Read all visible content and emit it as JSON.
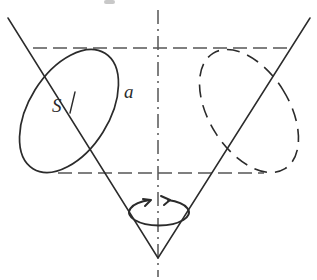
{
  "figure": {
    "background_color": "#ffffff",
    "stroke_color": "#2b2b2b",
    "dash_color": "#555555"
  },
  "labels": {
    "s": "S",
    "a": "a"
  },
  "geometry": {
    "canvas": {
      "width": 317,
      "height": 280
    },
    "apex": {
      "x": 158,
      "y": 258
    },
    "axis": {
      "name": "axis-of-revolution",
      "style": "dash-dot",
      "x": 158,
      "y_top": 10,
      "y_bottom": 277
    },
    "top_rim_line": {
      "name": "upper-construction-line",
      "style": "dashed",
      "y": 48,
      "x_start": 33,
      "x_end": 285
    },
    "mid_rim_line": {
      "name": "lower-construction-line",
      "style": "dashed",
      "y": 173,
      "x_start": 60,
      "x_end": 262
    },
    "cone_left_slant": {
      "x1": 8,
      "y1": 18,
      "x2": 158,
      "y2": 258
    },
    "cone_right_slant": {
      "x1": 310,
      "y1": 18,
      "x2": 158,
      "y2": 258
    },
    "ellipse_front": {
      "name": "visible-cross-section",
      "style": "solid",
      "cx": 69,
      "cy": 111,
      "rx": 40,
      "ry": 68,
      "rotation_deg": 32
    },
    "ellipse_back": {
      "name": "hidden-cross-section",
      "style": "dashed",
      "cx": 249,
      "cy": 111,
      "rx": 40,
      "ry": 68,
      "rotation_deg": -32
    },
    "rotation_arrow": {
      "name": "rotation-indicator",
      "cx": 158,
      "cy": 212,
      "rx": 30,
      "ry": 13,
      "direction": "counter-clockwise-viewed-from-above"
    },
    "tick_mark": {
      "name": "s-dimension-tick",
      "x1": 74,
      "y1": 93,
      "x2": 70,
      "y2": 112
    }
  }
}
